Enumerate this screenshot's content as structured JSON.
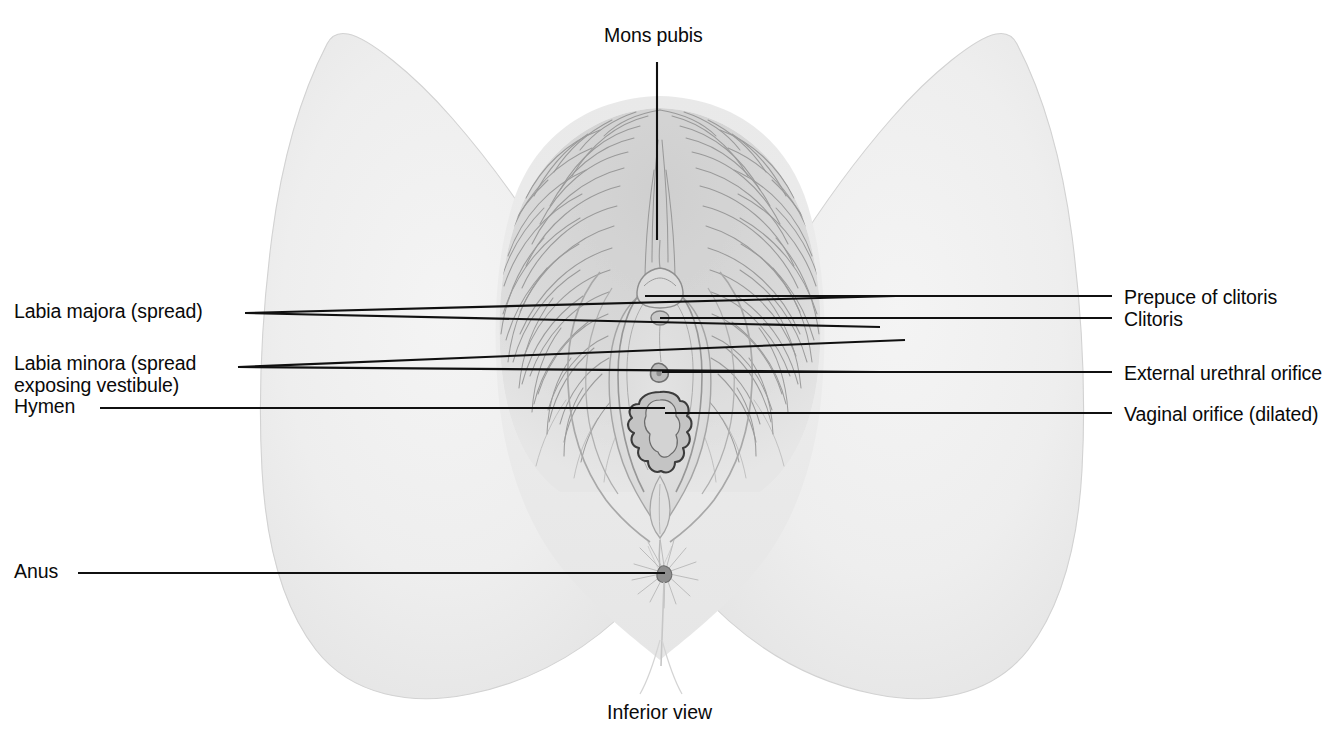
{
  "figure": {
    "caption": "Inferior view",
    "background_color": "#ffffff",
    "skin_color": "#ededed",
    "line_color": "#101010",
    "text_color": "#0a0a0a"
  },
  "labels": {
    "top": [
      {
        "id": "mons-pubis",
        "text": "Mons pubis",
        "side": "top",
        "x": 604,
        "y": 34,
        "leader": {
          "from": [
            657,
            62
          ],
          "to": [
            657,
            240
          ]
        }
      }
    ],
    "left": [
      {
        "id": "labia-majora",
        "text": "Labia majora (spread)",
        "x": 14,
        "y": 300,
        "leaders": [
          {
            "from": [
              245,
              313
            ],
            "to": [
              896,
              296
            ]
          },
          {
            "from": [
              245,
              313
            ],
            "to": [
              880,
              327
            ]
          }
        ]
      },
      {
        "id": "labia-minora",
        "text": "Labia minora (spread\nexposing vestibule)",
        "x": 14,
        "y": 352,
        "leaders": [
          {
            "from": [
              238,
              367
            ],
            "to": [
              905,
              340
            ]
          },
          {
            "from": [
              238,
              367
            ],
            "to": [
              880,
              372
            ]
          }
        ]
      },
      {
        "id": "hymen",
        "text": "Hymen",
        "x": 14,
        "y": 395,
        "leaders": [
          {
            "from": [
              100,
              408
            ],
            "to": [
              665,
              408
            ]
          }
        ]
      },
      {
        "id": "anus",
        "text": "Anus",
        "x": 14,
        "y": 560,
        "leaders": [
          {
            "from": [
              78,
              573
            ],
            "to": [
              665,
              573
            ]
          }
        ]
      }
    ],
    "right": [
      {
        "id": "prepuce-of-clitoris",
        "text": "Prepuce of clitoris",
        "x": 1124,
        "y": 286,
        "leaders": [
          {
            "from": [
              645,
              296
            ],
            "to": [
              1112,
              296
            ]
          }
        ]
      },
      {
        "id": "clitoris",
        "text": "Clitoris",
        "x": 1124,
        "y": 308,
        "leaders": [
          {
            "from": [
              660,
              318
            ],
            "to": [
              1112,
              318
            ]
          }
        ]
      },
      {
        "id": "external-urethral-orifice",
        "text": "External urethral orifice",
        "x": 1124,
        "y": 362,
        "leaders": [
          {
            "from": [
              662,
              372
            ],
            "to": [
              1112,
              372
            ]
          }
        ]
      },
      {
        "id": "vaginal-orifice",
        "text": "Vaginal orifice (dilated)",
        "x": 1124,
        "y": 403,
        "leaders": [
          {
            "from": [
              665,
              413
            ],
            "to": [
              1112,
              413
            ]
          }
        ]
      }
    ]
  },
  "caption": {
    "text": "Inferior view",
    "x": 607,
    "y": 711
  }
}
